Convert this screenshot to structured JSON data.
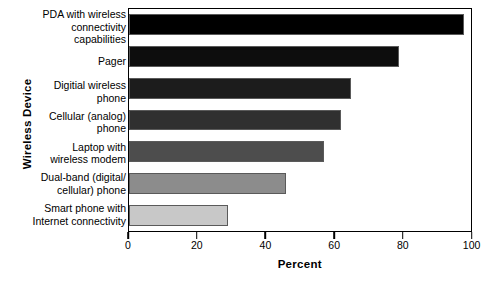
{
  "chart_data": {
    "type": "bar",
    "orientation": "horizontal",
    "title": "",
    "xlabel": "Percent",
    "ylabel": "Wireless Device",
    "xlim": [
      0,
      100
    ],
    "xticks": [
      0,
      20,
      40,
      60,
      80,
      100
    ],
    "xticklabels": [
      "0",
      "20",
      "40",
      "60",
      "80",
      "100"
    ],
    "grid": false,
    "legend": false,
    "categories": [
      "PDA with wireless\nconnectivity capabilities",
      "Pager",
      "Digitial wireless\nphone",
      "Cellular (analog)\nphone",
      "Laptop with\nwireless modem",
      "Dual-band (digital/\ncellular) phone",
      "Smart phone with\nInternet connectivity"
    ],
    "values": [
      98,
      79,
      65,
      62,
      57,
      46,
      29
    ],
    "bar_colors": [
      "#000000",
      "#0d0d0d",
      "#1c1c1c",
      "#303030",
      "#4d4d4d",
      "#8c8c8c",
      "#c8c8c8"
    ],
    "bar_edge_color": "#5a5a5a",
    "axis_color": "#000000"
  }
}
